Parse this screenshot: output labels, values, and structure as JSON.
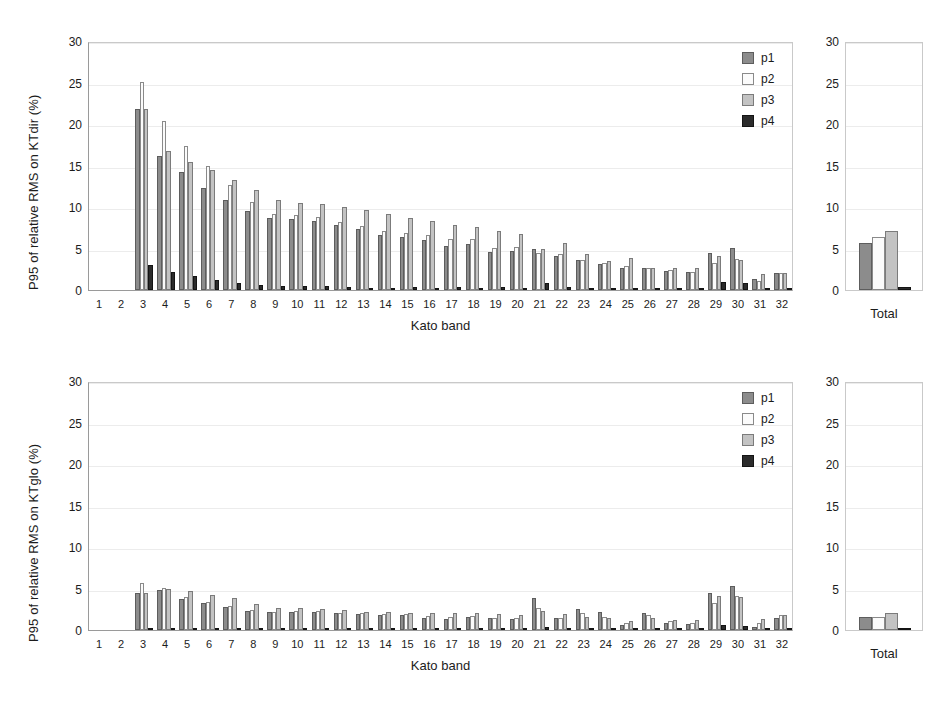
{
  "colors": {
    "p1": "#8c8c8c",
    "p2": "#fbfbfb",
    "p3": "#c3c3c3",
    "p4": "#2b2b2b",
    "grid": "#ececec",
    "axis": "#9a9a9a",
    "background": "#ffffff"
  },
  "legend": {
    "position": "top-right-inside",
    "entries": [
      {
        "key": "p1",
        "label": "p1"
      },
      {
        "key": "p2",
        "label": "p2"
      },
      {
        "key": "p3",
        "label": "p3"
      },
      {
        "key": "p4",
        "label": "p4"
      }
    ]
  },
  "total_label": "Total",
  "chart_data": [
    {
      "id": "ktdir",
      "type": "bar",
      "title": "",
      "xlabel": "Kato band",
      "ylabel": "P95 of relative RMS on KTdir (%)",
      "ylim": [
        0,
        30
      ],
      "yticks": [
        0,
        5,
        10,
        15,
        20,
        25,
        30
      ],
      "ytick_labels": [
        "0",
        "5",
        "10",
        "15",
        "20",
        "25",
        "30"
      ],
      "grid": true,
      "legend": [
        "p1",
        "p2",
        "p3",
        "p4"
      ],
      "categories": [
        "1",
        "2",
        "3",
        "4",
        "5",
        "6",
        "7",
        "8",
        "9",
        "10",
        "11",
        "12",
        "13",
        "14",
        "15",
        "16",
        "17",
        "18",
        "19",
        "20",
        "21",
        "22",
        "23",
        "24",
        "25",
        "26",
        "27",
        "28",
        "29",
        "30",
        "31",
        "32"
      ],
      "series": [
        {
          "name": "p1",
          "values": [
            0,
            0,
            21.8,
            16.2,
            14.2,
            12.3,
            10.9,
            9.5,
            8.7,
            8.6,
            8.3,
            7.8,
            7.3,
            6.6,
            6.4,
            6.0,
            5.3,
            5.6,
            4.6,
            4.7,
            4.9,
            4.1,
            3.6,
            3.1,
            2.7,
            2.6,
            2.3,
            2.2,
            4.4,
            5.1,
            1.3,
            2.0
          ]
        },
        {
          "name": "p2",
          "values": [
            0,
            0,
            25.1,
            20.4,
            17.3,
            14.9,
            12.6,
            10.6,
            9.2,
            9.0,
            8.8,
            8.2,
            7.7,
            7.1,
            6.9,
            6.6,
            6.1,
            6.2,
            5.1,
            5.2,
            4.5,
            4.3,
            3.6,
            3.3,
            2.9,
            2.6,
            2.4,
            2.2,
            3.2,
            3.7,
            1.1,
            2.1
          ]
        },
        {
          "name": "p3",
          "values": [
            0,
            0,
            21.8,
            16.7,
            15.4,
            14.5,
            13.2,
            12.0,
            10.9,
            10.5,
            10.4,
            10.0,
            9.7,
            9.1,
            8.7,
            8.3,
            7.8,
            7.6,
            7.1,
            6.8,
            4.9,
            5.7,
            4.3,
            3.5,
            3.8,
            2.6,
            2.7,
            2.7,
            4.1,
            3.6,
            1.9,
            2.1
          ]
        },
        {
          "name": "p4",
          "values": [
            0,
            0,
            3.0,
            2.2,
            1.7,
            1.2,
            0.9,
            0.6,
            0.5,
            0.5,
            0.5,
            0.4,
            0.2,
            0.3,
            0.4,
            0.3,
            0.4,
            0.3,
            0.4,
            0.3,
            0.8,
            0.4,
            0.2,
            0.3,
            0.2,
            0.2,
            0.1,
            0.2,
            1.0,
            0.8,
            0.2,
            0.2
          ]
        }
      ],
      "total": {
        "label": "Total",
        "ylim": [
          0,
          30
        ],
        "yticks": [
          0,
          5,
          10,
          15,
          20,
          25,
          30
        ],
        "values": {
          "p1": 5.7,
          "p2": 6.4,
          "p3": 7.1,
          "p4": 0.4
        }
      }
    },
    {
      "id": "ktglo",
      "type": "bar",
      "title": "",
      "xlabel": "Kato band",
      "ylabel": "P95 of relative RMS on KTglo (%)",
      "ylim": [
        0,
        30
      ],
      "yticks": [
        0,
        5,
        10,
        15,
        20,
        25,
        30
      ],
      "ytick_labels": [
        "0",
        "5",
        "10",
        "15",
        "20",
        "25",
        "30"
      ],
      "grid": true,
      "legend": [
        "p1",
        "p2",
        "p3",
        "p4"
      ],
      "categories": [
        "1",
        "2",
        "3",
        "4",
        "5",
        "6",
        "7",
        "8",
        "9",
        "10",
        "11",
        "12",
        "13",
        "14",
        "15",
        "16",
        "17",
        "18",
        "19",
        "20",
        "21",
        "22",
        "23",
        "24",
        "25",
        "26",
        "27",
        "28",
        "29",
        "30",
        "31",
        "32"
      ],
      "series": [
        {
          "name": "p1",
          "values": [
            0,
            0,
            4.4,
            4.8,
            3.7,
            3.2,
            2.8,
            2.3,
            2.2,
            2.2,
            2.2,
            2.1,
            1.9,
            1.8,
            1.8,
            1.5,
            1.3,
            1.6,
            1.4,
            1.3,
            3.8,
            1.4,
            2.5,
            2.2,
            0.6,
            2.1,
            0.9,
            0.7,
            4.4,
            5.3,
            0.4,
            1.4
          ]
        },
        {
          "name": "p2",
          "values": [
            0,
            0,
            5.7,
            5.1,
            4.0,
            3.4,
            2.9,
            2.4,
            2.2,
            2.3,
            2.3,
            2.1,
            2.0,
            1.9,
            1.9,
            1.7,
            1.6,
            1.7,
            1.5,
            1.4,
            2.7,
            1.5,
            2.0,
            1.6,
            0.8,
            1.8,
            1.1,
            0.8,
            3.3,
            4.1,
            0.8,
            1.8
          ]
        },
        {
          "name": "p3",
          "values": [
            0,
            0,
            4.4,
            5.0,
            4.7,
            4.2,
            3.8,
            3.1,
            2.7,
            2.7,
            2.5,
            2.4,
            2.2,
            2.2,
            2.1,
            2.1,
            2.1,
            2.0,
            1.9,
            1.8,
            2.3,
            1.9,
            1.6,
            1.5,
            1.1,
            1.5,
            1.2,
            1.2,
            4.1,
            4.0,
            1.3,
            1.8
          ]
        },
        {
          "name": "p4",
          "values": [
            0,
            0,
            0.2,
            0.2,
            0.1,
            0.1,
            0.1,
            0.1,
            0.1,
            0.1,
            0.1,
            0.1,
            0.1,
            0.1,
            0.1,
            0.1,
            0.1,
            0.1,
            0.1,
            0.1,
            0.4,
            0.1,
            0.2,
            0.2,
            0.1,
            0.1,
            0.1,
            0.1,
            0.6,
            0.5,
            0.1,
            0.1
          ]
        }
      ],
      "total": {
        "label": "Total",
        "ylim": [
          0,
          30
        ],
        "yticks": [
          0,
          5,
          10,
          15,
          20,
          25,
          30
        ],
        "values": {
          "p1": 1.6,
          "p2": 1.6,
          "p3": 2.0,
          "p4": 0.1
        }
      }
    }
  ]
}
